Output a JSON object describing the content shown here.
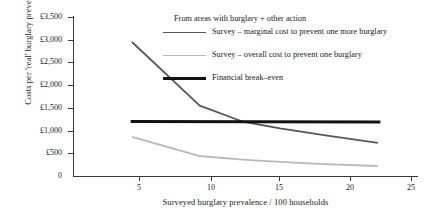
{
  "chart_data": {
    "type": "line",
    "title": "",
    "xlabel": "Surveyed burglary prevalence / 100 households",
    "ylabel": "Costs per 'real' burglary prevented",
    "xlim": [
      0,
      27.5
    ],
    "ylim": [
      0,
      3500
    ],
    "xticks": [
      5,
      10,
      15,
      20,
      25
    ],
    "xtick_labels": [
      "5",
      "10",
      "15",
      "20",
      "25"
    ],
    "yticks": [
      0,
      500,
      1000,
      1500,
      2000,
      2500,
      3000,
      3500
    ],
    "ytick_labels": [
      "0",
      "£500",
      "£1,000",
      "£1,500",
      "£2,000",
      "£2,500",
      "£3,000",
      "£3,500"
    ],
    "grid": false,
    "legend_position": "upper-right-inside",
    "legend_title": "From areas with burglary + other action",
    "series": [
      {
        "name": "Survey – marginal cost to prevent one more burglary",
        "color": "#575757",
        "width": 1.8,
        "x": [
          4.7,
          10.1,
          13.5,
          16.5,
          20.0,
          24.3
        ],
        "y": [
          2950,
          1550,
          1200,
          1050,
          900,
          730
        ]
      },
      {
        "name": "Survey – overall cost to prevent one burglary",
        "color": "#b9b9b9",
        "width": 1.8,
        "x": [
          4.7,
          10.1,
          13.5,
          16.5,
          20.0,
          24.3
        ],
        "y": [
          860,
          440,
          360,
          310,
          260,
          220
        ]
      },
      {
        "name": "Financial break–even",
        "color": "#111111",
        "width": 3.0,
        "x": [
          4.6,
          24.5
        ],
        "y": [
          1200,
          1190
        ]
      }
    ]
  },
  "legend": {
    "title": "From areas with burglary + other action",
    "entries": [
      {
        "label": "Survey – marginal cost to prevent one more burglary",
        "color": "#575757",
        "thickness": "1.8px"
      },
      {
        "label": "Survey – overall cost to prevent one burglary",
        "color": "#b9b9b9",
        "thickness": "1.8px"
      },
      {
        "label": "Financial break–even",
        "color": "#111111",
        "thickness": "3px"
      }
    ]
  },
  "axes": {
    "y_title": "Costs per 'real' burglary prevented",
    "x_title": "Surveyed burglary prevalence / 100 households",
    "y_labels": [
      "£3,500",
      "£3,000",
      "£2,500",
      "£2,000",
      "£1,500",
      "£1,000",
      "£500",
      "0"
    ],
    "x_labels": [
      "5",
      "10",
      "15",
      "20",
      "25"
    ]
  },
  "colors": {
    "axis": "#3a3a3a",
    "text": "#1a1a1a",
    "background": "#ffffff",
    "marginal": "#575757",
    "overall": "#b9b9b9",
    "breakeven": "#111111"
  }
}
